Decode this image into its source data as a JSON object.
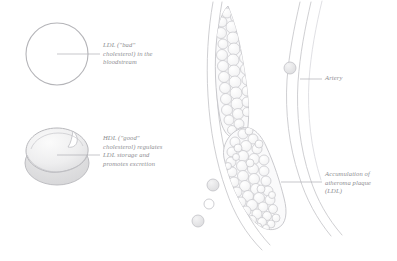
{
  "figure": {
    "background_color": "#ffffff",
    "ink_color": "#9a9a9e",
    "text_color": "#8e8e92",
    "fill_light": "#f0f0f1",
    "fill_mid": "#e2e2e3"
  },
  "labels": {
    "ldl": "LDL (\"bad\"\ncholesterol) in the\nbloodstream",
    "hdl": "HDL (\"good\"\ncholesterol) regulates\nLDL storage and\npromotes excretion",
    "artery": "Artery",
    "plaque": "Accumulation of\natheroma plaque\n(LDL)"
  },
  "shapes": {
    "ldl_particle": {
      "name": "ldl-circle",
      "cx": 57,
      "cy": 54,
      "r": 31
    },
    "hdl_particle": {
      "name": "hdl-disc",
      "cx": 57,
      "cy": 155,
      "rx": 32,
      "ry": 25
    },
    "artery": {
      "name": "artery-vessel",
      "wall_style": "double-line",
      "orientation": "curved-vertical"
    },
    "plaque_upper": {
      "name": "plaque-mass-upper",
      "circle_count": 34
    },
    "plaque_lower": {
      "name": "plaque-mass-lower",
      "circle_count": 46
    },
    "free_particles": [
      {
        "cx": 290,
        "cy": 68,
        "r": 6
      },
      {
        "cx": 213,
        "cy": 185,
        "r": 6
      },
      {
        "cx": 209,
        "cy": 204,
        "r": 5
      },
      {
        "cx": 198,
        "cy": 221,
        "r": 6
      }
    ]
  }
}
